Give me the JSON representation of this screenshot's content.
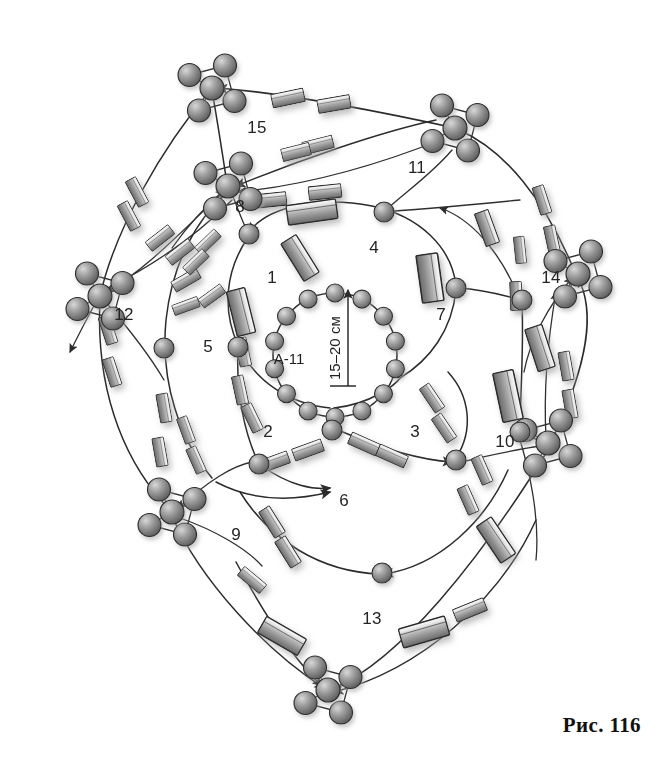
{
  "figure": {
    "caption": "Рис. 116",
    "center_code": "А-11",
    "dimension_label": "15–20 см",
    "background_color": "#ffffff",
    "line_color": "#2b2b2b",
    "element_fill_light": "#f2f2f2",
    "element_fill_dark": "#6f6f6f",
    "sphere_fill": "#8c8c8c",
    "shadow_color": "#b9b9b9"
  },
  "numbered_labels": [
    {
      "id": "1",
      "text": "1",
      "x": 272,
      "y": 283
    },
    {
      "id": "2",
      "text": "2",
      "x": 268,
      "y": 437
    },
    {
      "id": "3",
      "text": "3",
      "x": 415,
      "y": 437
    },
    {
      "id": "4",
      "text": "4",
      "x": 374,
      "y": 253
    },
    {
      "id": "5",
      "text": "5",
      "x": 208,
      "y": 352
    },
    {
      "id": "6",
      "text": "6",
      "x": 344,
      "y": 506
    },
    {
      "id": "7",
      "text": "7",
      "x": 441,
      "y": 320
    },
    {
      "id": "8",
      "text": "8",
      "x": 240,
      "y": 212
    },
    {
      "id": "9",
      "text": "9",
      "x": 236,
      "y": 540
    },
    {
      "id": "10",
      "text": "10",
      "x": 505,
      "y": 447
    },
    {
      "id": "11",
      "text": "11",
      "x": 417,
      "y": 173
    },
    {
      "id": "12",
      "text": "12",
      "x": 124,
      "y": 320
    },
    {
      "id": "13",
      "text": "13",
      "x": 372,
      "y": 624
    },
    {
      "id": "14",
      "text": "14",
      "x": 551,
      "y": 283
    },
    {
      "id": "15",
      "text": "15",
      "x": 257,
      "y": 133
    }
  ],
  "sphere_clusters": [
    {
      "name": "cluster-top",
      "hub_x": 212,
      "hub_y": 88,
      "count": 4
    },
    {
      "name": "cluster-upper-right",
      "hub_x": 455,
      "hub_y": 128,
      "count": 4
    },
    {
      "name": "cluster-upper-left",
      "hub_x": 228,
      "hub_y": 186,
      "count": 4
    },
    {
      "name": "cluster-left",
      "hub_x": 100,
      "hub_y": 296,
      "count": 4
    },
    {
      "name": "cluster-right",
      "hub_x": 578,
      "hub_y": 274,
      "count": 4
    },
    {
      "name": "cluster-lower-left",
      "hub_x": 172,
      "hub_y": 512,
      "count": 4
    },
    {
      "name": "cluster-lower-right",
      "hub_x": 548,
      "hub_y": 443,
      "count": 4
    },
    {
      "name": "cluster-bottom",
      "hub_x": 328,
      "hub_y": 690,
      "count": 4
    }
  ],
  "inner_ring": {
    "name": "inner-sphere-ring",
    "center_x": 335,
    "center_y": 355,
    "radius": 62,
    "sphere_count": 14
  },
  "loops": [
    {
      "name": "loop-1-inner",
      "label": "1"
    },
    {
      "name": "loop-2-left",
      "label": "2"
    },
    {
      "name": "loop-3-right",
      "label": "3"
    },
    {
      "name": "loop-4-upper",
      "label": "4"
    },
    {
      "name": "loop-5-outer",
      "label": "5"
    },
    {
      "name": "loop-6-lower",
      "label": "6"
    },
    {
      "name": "loop-7-right",
      "label": "7"
    }
  ]
}
